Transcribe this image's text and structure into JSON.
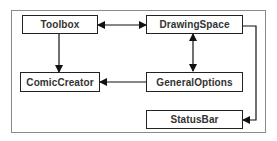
{
  "diagram": {
    "nodes": [
      {
        "id": "toolbox",
        "label": "Toolbox"
      },
      {
        "id": "drawingspace",
        "label": "DrawingSpace"
      },
      {
        "id": "comiccreator",
        "label": "ComicCreator"
      },
      {
        "id": "generaloptions",
        "label": "GeneralOptions"
      },
      {
        "id": "statusbar",
        "label": "StatusBar"
      }
    ],
    "edges": [
      {
        "from": "toolbox",
        "to": "drawingspace",
        "direction": "both"
      },
      {
        "from": "toolbox",
        "to": "comiccreator",
        "direction": "forward"
      },
      {
        "from": "drawingspace",
        "to": "generaloptions",
        "direction": "both"
      },
      {
        "from": "generaloptions",
        "to": "comiccreator",
        "direction": "forward"
      },
      {
        "from": "drawingspace",
        "to": "statusbar",
        "direction": "forward"
      }
    ],
    "colors": {
      "line": "#111111",
      "frame": "#8a8a8a",
      "text": "#333333"
    }
  }
}
